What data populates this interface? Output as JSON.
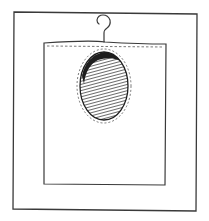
{
  "figure": {
    "colors": {
      "background": "#ffffff",
      "stroke": "#3a3a3a",
      "fill_dark": "#2a2a2a"
    },
    "elements": {
      "outer_frame": "outer-frame",
      "bag": "bag",
      "hook": "hook-icon",
      "oval_window": "oval-window"
    }
  }
}
